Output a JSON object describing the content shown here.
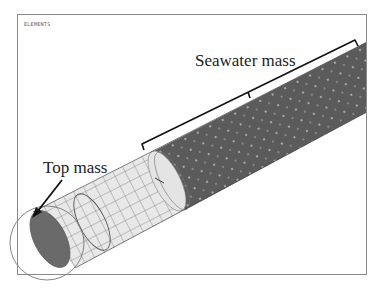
{
  "viewport": {
    "label": "ELEMENTS"
  },
  "annotations": {
    "seawater_mass": "Seawater mass",
    "top_mass": "Top mass"
  },
  "model": {
    "description": "FE mesh of a cylindrical riser segment",
    "sections": [
      {
        "name": "top-mass-section",
        "color": "#e6e6e6",
        "mesh": "visible quad grid"
      },
      {
        "name": "seawater-mass-section",
        "color": "#5a5a5a",
        "mesh": "dense, dotted nodes"
      }
    ],
    "end_cap_color": "#6a6a6a",
    "highlight_circle_color": "#777777"
  }
}
